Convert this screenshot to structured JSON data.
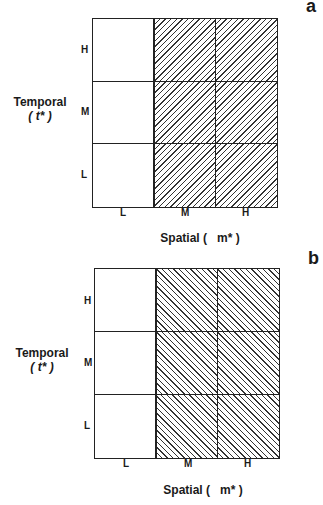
{
  "panels": [
    {
      "letter": "a",
      "hatch": "forward",
      "y_axis": {
        "label": "Temporal",
        "symbol": "( t* )",
        "ticks": [
          "H",
          "M",
          "L"
        ]
      },
      "x_axis": {
        "label": "Spatial (   m* )",
        "ticks": [
          "L",
          "M",
          "H"
        ]
      },
      "shaded_columns": [
        "M",
        "H"
      ]
    },
    {
      "letter": "b",
      "hatch": "backward",
      "y_axis": {
        "label": "Temporal",
        "symbol": "( t* )",
        "ticks": [
          "H",
          "M",
          "L"
        ]
      },
      "x_axis": {
        "label": "Spatial (   m* )",
        "ticks": [
          "L",
          "M",
          "H"
        ]
      },
      "shaded_columns": [
        "M",
        "H"
      ]
    }
  ]
}
